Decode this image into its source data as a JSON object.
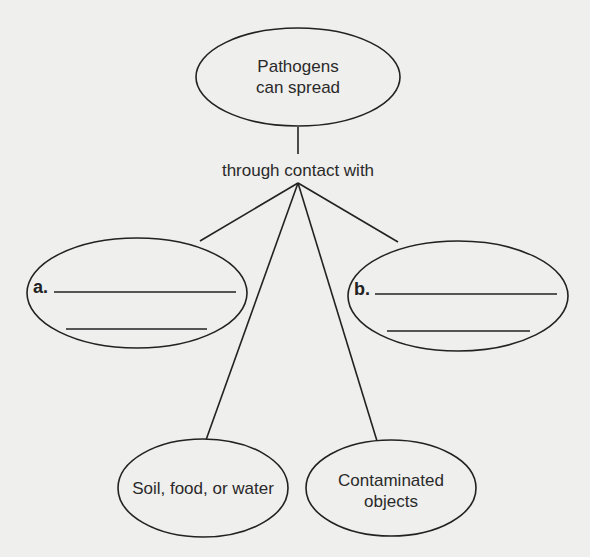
{
  "diagram": {
    "type": "concept-map",
    "root": {
      "line1": "Pathogens",
      "line2": "can spread"
    },
    "connector": "through contact with",
    "branches": [
      {
        "id": "a",
        "label": "a.",
        "type": "blank",
        "blank_lines": 2
      },
      {
        "id": "soil",
        "text": "Soil, food, or water",
        "type": "filled"
      },
      {
        "id": "objects",
        "line1": "Contaminated",
        "line2": "objects",
        "type": "filled"
      },
      {
        "id": "b",
        "label": "b.",
        "type": "blank",
        "blank_lines": 2
      }
    ]
  },
  "colors": {
    "background": "#efefed",
    "stroke": "#222222",
    "text": "#2a2a2a"
  }
}
